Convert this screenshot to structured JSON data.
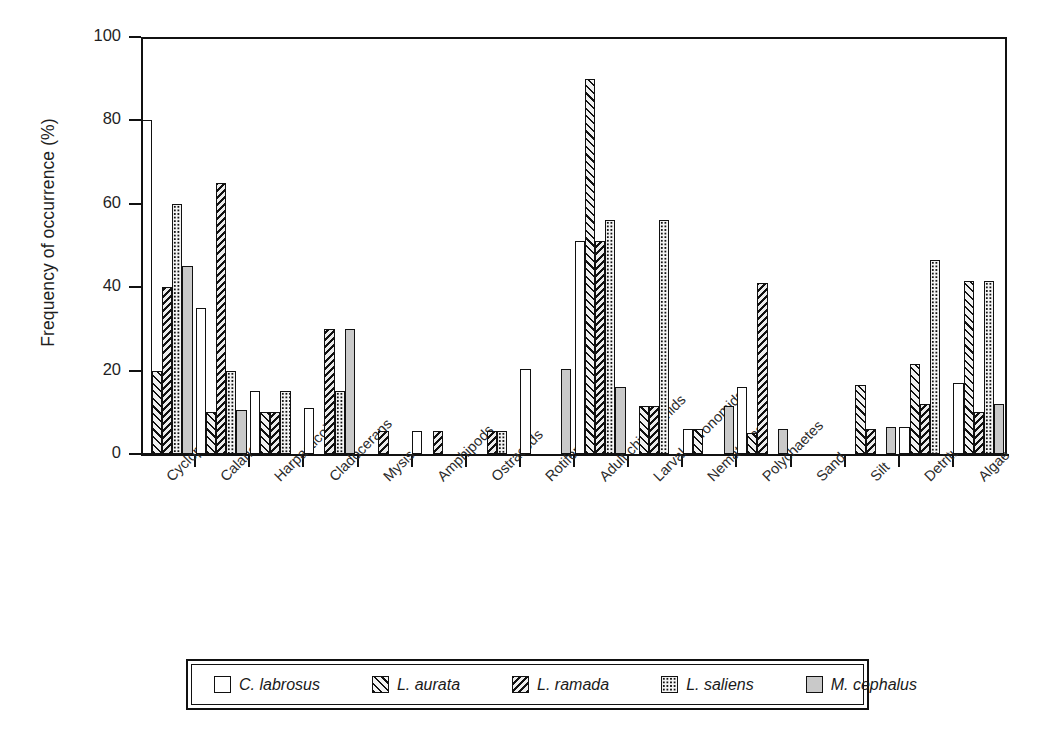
{
  "chart_data": {
    "type": "bar",
    "title": "",
    "xlabel": "",
    "ylabel": "Frequency of occurrence (%)",
    "ylim": [
      0,
      100
    ],
    "yticks": [
      0,
      20,
      40,
      60,
      80,
      100
    ],
    "grid": false,
    "legend_position": "bottom",
    "categories": [
      "Cyclopoids",
      "Calanoids",
      "Harpacticoids",
      "Cladocerans",
      "Mysis",
      "Amphipods",
      "Ostracods",
      "Rotifers",
      "Adult chironomids",
      "Larval chironomids",
      "Nematodes",
      "Polychaetes",
      "Sand",
      "Silt",
      "Detritus",
      "Algae"
    ],
    "series": [
      {
        "name": "C. labrosus",
        "pattern": "white",
        "values": [
          80,
          35,
          15,
          11,
          0,
          5.5,
          0,
          20.5,
          51,
          0,
          6,
          16,
          0,
          0,
          6.5,
          17
        ]
      },
      {
        "name": "L. aurata",
        "pattern": "forward-diagonal-hatch",
        "values": [
          20,
          10,
          10,
          0,
          0,
          0,
          0,
          0,
          90,
          11.5,
          6,
          5,
          0,
          16.5,
          21.5,
          41.5
        ]
      },
      {
        "name": "L. ramada",
        "pattern": "backward-diagonal-hatch",
        "values": [
          40,
          65,
          10,
          30,
          5.5,
          5.5,
          5.5,
          0,
          51,
          11.5,
          0,
          41,
          0,
          6,
          12,
          10
        ]
      },
      {
        "name": "L. saliens",
        "pattern": "dotted",
        "values": [
          60,
          20,
          15,
          15,
          0,
          0,
          5.5,
          0,
          56,
          56,
          0,
          0,
          0,
          0,
          46.5,
          41.5
        ]
      },
      {
        "name": "M. cephalus",
        "pattern": "solid-gray",
        "values": [
          45,
          10.5,
          0,
          30,
          0,
          0,
          0,
          20.5,
          16,
          0,
          11.5,
          6,
          0,
          6.5,
          0,
          12
        ]
      }
    ]
  },
  "legend": {
    "items": [
      {
        "label": "C. labrosus"
      },
      {
        "label": "L. aurata"
      },
      {
        "label": "L. ramada"
      },
      {
        "label": "L. saliens"
      },
      {
        "label": "M. cephalus"
      }
    ]
  },
  "colors": {
    "axis": "#111111",
    "text": "#1f1f1f",
    "series_gray": "#c9c9c9",
    "background": "#ffffff"
  }
}
